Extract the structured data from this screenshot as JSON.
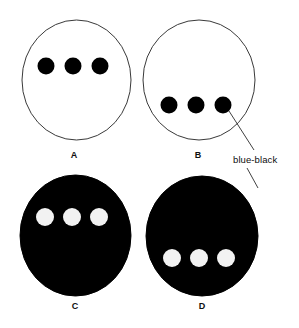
{
  "figure": {
    "background_color": "#ffffff",
    "outline_color": "#3a3a3a",
    "fill_black": "#000000",
    "fill_white": "#ffffff",
    "panels": [
      {
        "id": "A",
        "label": "A",
        "disc": {
          "cx": 76.5,
          "cy": 80,
          "rx": 54.5,
          "ry": 60
        },
        "disc_fill": "#ffffff",
        "disc_stroke": "#3a3a3a",
        "dot_fill": "#000000",
        "dot_radius": 8.5,
        "dot_cy": 66,
        "dot_cx": [
          46,
          73,
          100
        ]
      },
      {
        "id": "B",
        "label": "B",
        "disc": {
          "cx": 199,
          "cy": 80,
          "rx": 56,
          "ry": 60
        },
        "disc_fill": "#ffffff",
        "disc_stroke": "#3a3a3a",
        "dot_fill": "#000000",
        "dot_radius": 8.5,
        "dot_cy": 105,
        "dot_cx": [
          169,
          196,
          223
        ]
      },
      {
        "id": "C",
        "label": "C",
        "disc": {
          "cx": 75.5,
          "cy": 235.5,
          "rx": 55.5,
          "ry": 60.5
        },
        "disc_fill": "#000000",
        "disc_stroke": "#000000",
        "dot_fill": "#f2f2f2",
        "dot_radius": 9,
        "dot_cy": 217,
        "dot_cx": [
          45,
          72,
          99
        ]
      },
      {
        "id": "D",
        "label": "D",
        "disc": {
          "cx": 202,
          "cy": 236,
          "rx": 56,
          "ry": 60
        },
        "disc_fill": "#000000",
        "disc_stroke": "#000000",
        "dot_fill": "#f2f2f2",
        "dot_radius": 9,
        "dot_cy": 258,
        "dot_cx": [
          172,
          199,
          226
        ]
      }
    ],
    "annotations": [
      {
        "id": "blue-black",
        "text": "blue-black",
        "leader_from_b": {
          "x1": 229,
          "y1": 111,
          "x2": 254,
          "y2": 150
        },
        "leader_to_d": {
          "x1": 247,
          "y1": 168,
          "x2": 258,
          "y2": 188
        },
        "color": "#0d0d0d"
      }
    ]
  }
}
